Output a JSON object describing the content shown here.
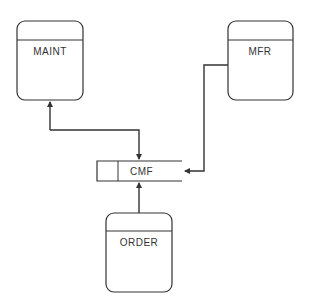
{
  "diagram": {
    "type": "data-flow",
    "colors": {
      "stroke": "#333333",
      "background": "#ffffff",
      "text": "#333333"
    },
    "nodes": [
      {
        "id": "maint",
        "label": "MAINT",
        "shape": "process"
      },
      {
        "id": "mfr",
        "label": "MFR",
        "shape": "process"
      },
      {
        "id": "cmf",
        "label": "CMF",
        "shape": "data-store"
      },
      {
        "id": "order",
        "label": "ORDER",
        "shape": "process"
      }
    ],
    "edges": [
      {
        "from": "cmf",
        "to": "maint",
        "bidirectional": true
      },
      {
        "from": "mfr",
        "to": "cmf",
        "bidirectional": false
      },
      {
        "from": "order",
        "to": "cmf",
        "bidirectional": false
      }
    ]
  }
}
